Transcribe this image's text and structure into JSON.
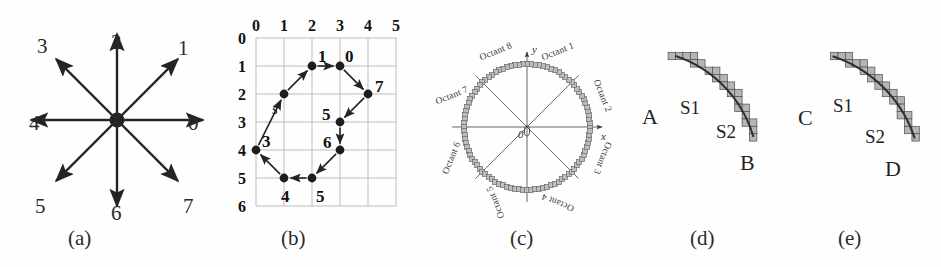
{
  "figure": {
    "background_color": "#fefefe",
    "ink_color": "#242424",
    "grid_color": "#b9b9b9",
    "fill_color": "#9a9a9a"
  },
  "captions": [
    {
      "id": "a",
      "label": "(a)",
      "x": 68,
      "y": 228
    },
    {
      "id": "b",
      "label": "(b)",
      "x": 281,
      "y": 228
    },
    {
      "id": "c",
      "label": "(c)",
      "x": 510,
      "y": 228
    },
    {
      "id": "d",
      "label": "(d)",
      "x": 690,
      "y": 228
    },
    {
      "id": "e",
      "label": "(e)",
      "x": 838,
      "y": 228
    }
  ],
  "panel_a": {
    "name": "eight-direction-chain-code-star",
    "center": {
      "x": 117,
      "y": 120
    },
    "arrow_length": 86,
    "directions": [
      {
        "code": "0",
        "angle_deg": 0,
        "label_x": 188,
        "label_y": 113
      },
      {
        "code": "1",
        "angle_deg": 45,
        "label_x": 178,
        "label_y": 38
      },
      {
        "code": "2",
        "angle_deg": 90,
        "label_x": 111,
        "label_y": 32
      },
      {
        "code": "3",
        "angle_deg": 135,
        "label_x": 37,
        "label_y": 36
      },
      {
        "code": "4",
        "angle_deg": 180,
        "label_x": 29,
        "label_y": 113
      },
      {
        "code": "5",
        "angle_deg": 225,
        "label_x": 35,
        "label_y": 196
      },
      {
        "code": "6",
        "angle_deg": 270,
        "label_x": 111,
        "label_y": 203
      },
      {
        "code": "7",
        "angle_deg": 315,
        "label_x": 183,
        "label_y": 196
      }
    ]
  },
  "panel_b": {
    "name": "chain-code-boundary-on-grid",
    "grid": {
      "origin": {
        "x": 46,
        "y": 38
      },
      "cell": 28,
      "cols": 5,
      "rows": 6,
      "col_labels": [
        "0",
        "1",
        "2",
        "3",
        "4",
        "5"
      ],
      "row_labels": [
        "0",
        "1",
        "2",
        "3",
        "4",
        "5",
        "6"
      ]
    },
    "start_label": "s",
    "points": [
      {
        "gx": 1,
        "gy": 2,
        "label": "s",
        "label_dx": -12,
        "label_dy": 18,
        "italic": true
      },
      {
        "gx": 2,
        "gy": 1,
        "label": "1",
        "label_dx": 6,
        "label_dy": -8,
        "italic": false
      },
      {
        "gx": 3,
        "gy": 1,
        "label": "0",
        "label_dx": 5,
        "label_dy": -8,
        "italic": false
      },
      {
        "gx": 4,
        "gy": 2,
        "label": "7",
        "label_dx": 7,
        "label_dy": -6,
        "italic": false
      },
      {
        "gx": 3,
        "gy": 3,
        "label": "5",
        "label_dx": -18,
        "label_dy": -6,
        "italic": false
      },
      {
        "gx": 3,
        "gy": 4,
        "label": "6",
        "label_dx": -17,
        "label_dy": -6,
        "italic": false
      },
      {
        "gx": 2,
        "gy": 5,
        "label": "5",
        "label_dx": 4,
        "label_dy": 20,
        "italic": false
      },
      {
        "gx": 1,
        "gy": 5,
        "label": "4",
        "label_dx": -3,
        "label_dy": 20,
        "italic": false
      },
      {
        "gx": 0,
        "gy": 4,
        "label": "3",
        "label_dx": 6,
        "label_dy": -7,
        "italic": false
      }
    ]
  },
  "panel_c": {
    "name": "octant-decomposition-of-circle",
    "center": {
      "x": 122,
      "y": 127
    },
    "radius": 63,
    "origin_label": "0",
    "axis_labels": [
      {
        "text": "y",
        "x": 127,
        "y": 44
      },
      {
        "text": "x",
        "x": 196,
        "y": 131
      }
    ],
    "octants": [
      {
        "text": "Octant 1",
        "angle_deg": 67.5,
        "rotate": -22
      },
      {
        "text": "Octant 2",
        "angle_deg": 22.5,
        "rotate": 68
      },
      {
        "text": "Octant 3",
        "angle_deg": -22.5,
        "rotate": 112
      },
      {
        "text": "Octant 4",
        "angle_deg": -67.5,
        "rotate": 202
      },
      {
        "text": "Octant 5",
        "angle_deg": -112.5,
        "rotate": 248
      },
      {
        "text": "Octant 6",
        "angle_deg": -157.5,
        "rotate": 292
      },
      {
        "text": "Octant 7",
        "angle_deg": 157.5,
        "rotate": -22
      },
      {
        "text": "Octant 8",
        "angle_deg": 112.5,
        "rotate": -22
      }
    ]
  },
  "panel_d": {
    "name": "arc-segment-AB-with-staircase",
    "labels": [
      {
        "text": "A",
        "x": 22,
        "y": 106,
        "size": "big"
      },
      {
        "text": "S1",
        "x": 60,
        "y": 98,
        "size": "small"
      },
      {
        "text": "S2",
        "x": 96,
        "y": 122,
        "size": "small"
      },
      {
        "text": "B",
        "x": 120,
        "y": 152,
        "size": "big"
      }
    ],
    "arc": {
      "cx": 18,
      "cy": 170,
      "r": 120,
      "start_deg": 72,
      "end_deg": 16
    }
  },
  "panel_e": {
    "name": "arc-segment-CD-with-staircase",
    "labels": [
      {
        "text": "C",
        "x": 23,
        "y": 107,
        "size": "big"
      },
      {
        "text": "S1",
        "x": 58,
        "y": 96,
        "size": "small"
      },
      {
        "text": "S2",
        "x": 90,
        "y": 127,
        "size": "small"
      },
      {
        "text": "D",
        "x": 110,
        "y": 158,
        "size": "big"
      }
    ],
    "arc": {
      "cx": 18,
      "cy": 178,
      "r": 128,
      "start_deg": 72,
      "end_deg": 18
    }
  }
}
